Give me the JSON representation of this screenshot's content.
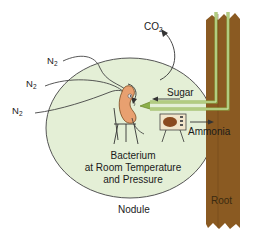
{
  "diagram": {
    "labels": {
      "co2": "CO",
      "co2_sub": "2",
      "n2_a": "N",
      "n2_b": "N",
      "n2_c": "N",
      "n2_sub": "2",
      "sugar": "Sugar",
      "ammonia": "Ammonia",
      "bacterium_line1": "Bacterium",
      "bacterium_line2": "at Room Temperature",
      "bacterium_line3": "and Pressure",
      "nodule": "Nodule",
      "root": "Root"
    },
    "colors": {
      "nodule_fill": "#e4efd6",
      "nodule_stroke": "#555555",
      "root_fill": "#8a5a22",
      "root_dark": "#6e4418",
      "vessel_green": "#8bb04a",
      "vessel_light": "#d9e8b8",
      "bacterium_body": "#e8a070",
      "tv_body": "#f2e6cc",
      "tv_screen": "#8a4a20"
    }
  }
}
